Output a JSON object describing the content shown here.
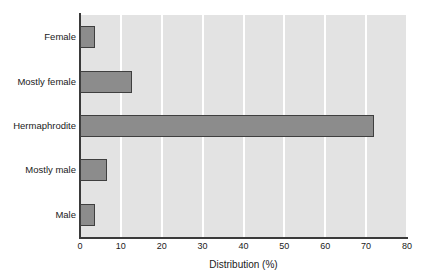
{
  "chart_data": {
    "type": "bar",
    "orientation": "horizontal",
    "title": "",
    "xlabel": "Distribution (%)",
    "ylabel": "",
    "xlim": [
      0,
      80
    ],
    "xticks": [
      0,
      10,
      20,
      30,
      40,
      50,
      60,
      70,
      80
    ],
    "xtick_labels": [
      "0",
      "10",
      "20",
      "30",
      "40",
      "50",
      "60",
      "70",
      "80"
    ],
    "grid": "vertical-only",
    "legend": "none",
    "categories": [
      "Female",
      "Mostly female",
      "Hermaphrodite",
      "Mostly male",
      "Male"
    ],
    "values": [
      3.7,
      12.8,
      72.0,
      6.6,
      3.7
    ],
    "colors": {
      "bar_fill": "#8c8c8c",
      "bar_edge": "#3f3f3f",
      "plot_background": "#e3e3e3",
      "gridline": "#ffffff",
      "axis_line": "#3a3a3a",
      "text": "#1a1a1a",
      "figure_background": "#ffffff"
    }
  }
}
